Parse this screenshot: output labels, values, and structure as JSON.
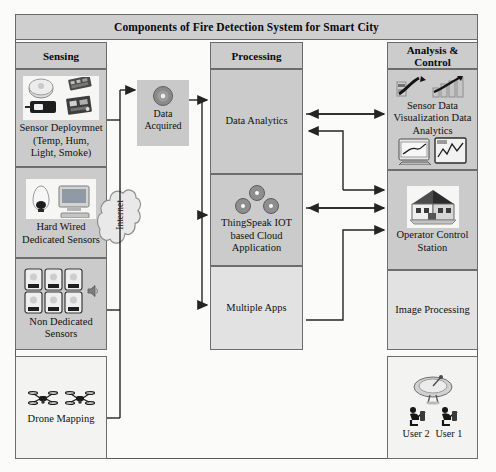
{
  "diagram": {
    "title": "Components of Fire Detection System for Smart City",
    "columns": [
      {
        "key": "sensing",
        "label": "Sensing"
      },
      {
        "key": "processing",
        "label": "Processing"
      },
      {
        "key": "analysis",
        "label": "Analysis & Control"
      }
    ],
    "sensing_blocks": [
      {
        "label": "Sensor Deploymnet (Temp, Hum, Light, Smoke)",
        "icon": "sensor-modules-icon",
        "fill": "#cbcbcb"
      },
      {
        "label": "Hard Wired Dedicated Sensors",
        "icon": "wired-sensor-computer-icon",
        "fill": "#cbcbcb"
      },
      {
        "label": "Non Dedicated Sensors",
        "icon": "smartphones-grid-icon",
        "fill": "#cbcbcb"
      },
      {
        "label": "Drone Mapping",
        "icon": "drone-icon",
        "fill": "#f3f3f2"
      }
    ],
    "network": {
      "cloud_label": "Internet",
      "cloud_icon": "cloud-icon",
      "data_node_label_line1": "Data",
      "data_node_label_line2": "Acquired",
      "data_node_icon": "disc-icon"
    },
    "processing_blocks": [
      {
        "label": "Data Analytics",
        "icon": "",
        "fill": "#cbcbcb"
      },
      {
        "label": "ThingSpeak IOT based Cloud Application",
        "icon": "thingspeak-dots-icon",
        "fill": "#cbcbcb"
      },
      {
        "label": "Multiple Apps",
        "icon": "",
        "fill": "#e2e2e2"
      }
    ],
    "analysis_blocks": [
      {
        "label": "Sensor Data Visualization Data Analytics",
        "icon": "charts-icon",
        "fill": "#cbcbcb"
      },
      {
        "label": "Operator Control Station",
        "icon": "house-icon",
        "fill": "#cbcbcb"
      },
      {
        "label": "Image Processing",
        "icon": "",
        "fill": "#e2e2e2"
      },
      {
        "label": "User 2   User 1",
        "icon": "satellite-dish-users-icon",
        "fill": "#f3f3f2"
      }
    ],
    "users": {
      "user2": "User 2",
      "user1": "User 1"
    },
    "colors": {
      "header_fill": "#cfcfcf",
      "block_gray": "#cbcbcb",
      "block_light": "#e2e2e2",
      "block_white": "#f3f3f2",
      "line": "#2b2b2b",
      "border": "#6a6a6a"
    }
  }
}
